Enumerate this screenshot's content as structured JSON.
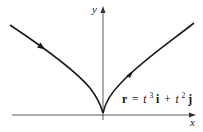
{
  "diagram": {
    "type": "parametric-curve",
    "axes": {
      "x_label": "x",
      "y_label": "y"
    },
    "curve": {
      "name": "semicubical-parabola",
      "equation": {
        "r": "r",
        "equals": "=",
        "t1": "t",
        "exp1": "3",
        "i": "i",
        "plus": "+",
        "t2": "t",
        "exp2": "2",
        "j": "j"
      },
      "equation_text": "r = t³i + t²j",
      "direction_arrows": 2,
      "stroke_color": "#1a1a1a"
    },
    "colors": {
      "axis": "#333333",
      "curve": "#1a1a1a",
      "background": "#ffffff"
    }
  }
}
